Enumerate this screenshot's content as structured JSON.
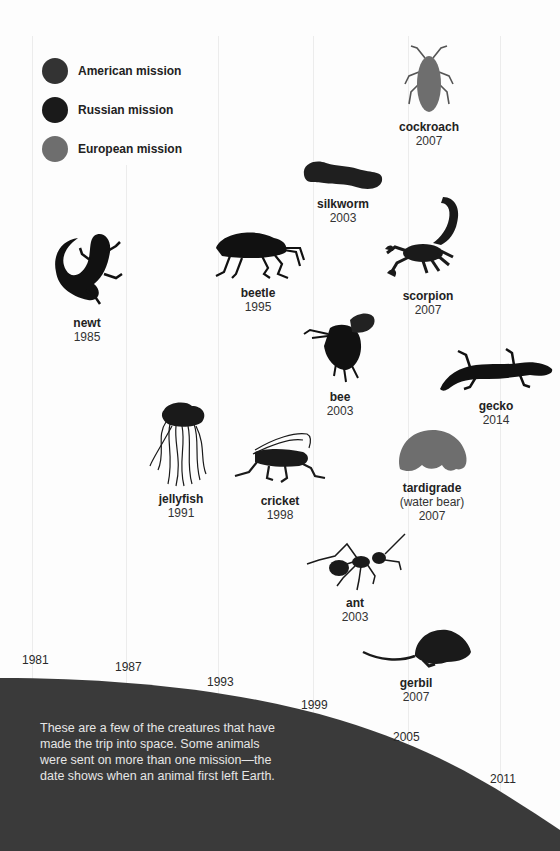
{
  "legend": {
    "items": [
      {
        "label": "American mission",
        "color": "#333333"
      },
      {
        "label": "Russian mission",
        "color": "#1a1a1a"
      },
      {
        "label": "European mission",
        "color": "#6e6e6e"
      }
    ]
  },
  "timeline": {
    "years": [
      "1981",
      "1987",
      "1993",
      "1999",
      "2005",
      "2011"
    ]
  },
  "animals": [
    {
      "name": "newt",
      "year": "1985",
      "icon": "newt-icon"
    },
    {
      "name": "jellyfish",
      "year": "1991",
      "icon": "jellyfish-icon"
    },
    {
      "name": "beetle",
      "year": "1995",
      "icon": "beetle-icon"
    },
    {
      "name": "cricket",
      "year": "1998",
      "icon": "cricket-icon"
    },
    {
      "name": "silkworm",
      "year": "2003",
      "icon": "silkworm-icon"
    },
    {
      "name": "bee",
      "year": "2003",
      "icon": "bee-icon"
    },
    {
      "name": "ant",
      "year": "2003",
      "icon": "ant-icon"
    },
    {
      "name": "cockroach",
      "year": "2007",
      "icon": "cockroach-icon"
    },
    {
      "name": "scorpion",
      "year": "2007",
      "icon": "scorpion-icon"
    },
    {
      "name": "tardigrade",
      "note": "(water bear)",
      "year": "2007",
      "icon": "tardigrade-icon"
    },
    {
      "name": "gerbil",
      "year": "2007",
      "icon": "gerbil-icon"
    },
    {
      "name": "gecko",
      "year": "2014",
      "icon": "gecko-icon"
    }
  ],
  "caption": "These are a few of the creatures that have made the trip into space. Some animals were sent on more than one mission—the date shows when an animal first left Earth."
}
